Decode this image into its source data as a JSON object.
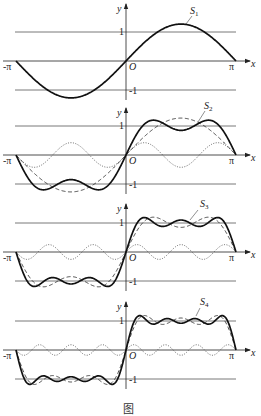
{
  "chart_data": {
    "type": "line",
    "title": "",
    "xlabel": "x",
    "ylabel": "y",
    "xlim": [
      "-π",
      "π"
    ],
    "ylim": [
      -1.3,
      1.3
    ],
    "x_tick_labels": [
      "-π",
      "O",
      "π"
    ],
    "y_tick_labels": [
      "1",
      "-1"
    ],
    "reference_lines": [
      1,
      -1
    ],
    "formula": "S_n(x) = (4/π) Σ_{k=1..n} sin((2k-1)x)/(2k-1)",
    "panels": [
      {
        "label": "S",
        "subscript": "1",
        "terms": 1,
        "series": [
          {
            "name": "S1",
            "style": "solid",
            "amplitude_max": 1.27
          }
        ]
      },
      {
        "label": "S",
        "subscript": "2",
        "terms": 2,
        "series": [
          {
            "name": "S2",
            "style": "solid"
          },
          {
            "name": "S1",
            "style": "dashed"
          },
          {
            "name": "(4/3π) sin 3x",
            "style": "dotted",
            "amplitude": 0.42
          }
        ]
      },
      {
        "label": "S",
        "subscript": "3",
        "terms": 3,
        "series": [
          {
            "name": "S3",
            "style": "solid"
          },
          {
            "name": "S2",
            "style": "dashed"
          },
          {
            "name": "(4/5π) sin 5x",
            "style": "dotted",
            "amplitude": 0.25
          }
        ]
      },
      {
        "label": "S",
        "subscript": "4",
        "terms": 4,
        "series": [
          {
            "name": "S4",
            "style": "solid"
          },
          {
            "name": "S3",
            "style": "dashed"
          },
          {
            "name": "(4/7π) sin 7x",
            "style": "dotted",
            "amplitude": 0.18
          }
        ]
      }
    ]
  },
  "labels": {
    "x_axis": "x",
    "y_axis": "y",
    "origin": "O",
    "neg_pi": "-π",
    "pi": "π",
    "one": "1",
    "neg_one": "-1"
  },
  "layout": {
    "x_origin_px": 126,
    "px_per_pi": 110,
    "px_per_unit_y": 29,
    "panel_axis_y": [
      61,
      155,
      252,
      350
    ]
  },
  "caption": "图"
}
